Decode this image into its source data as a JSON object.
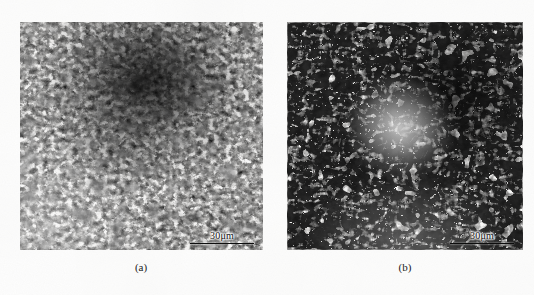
{
  "figure": {
    "type": "micrograph-pair",
    "background_color": "#fdfdfc",
    "panels": [
      {
        "id": "a",
        "caption": "(a)",
        "scale_bar": {
          "label": "30μm",
          "value": 30,
          "unit": "μm"
        },
        "description": "Optical metallographic micrograph, fine dendritic/eutectic microstructure with a dark coarse-phase cluster toward the upper centre"
      },
      {
        "id": "b",
        "caption": "(b)",
        "scale_bar": {
          "label": "30μm",
          "value": 30,
          "unit": "μm"
        },
        "description": "Optical metallographic micrograph, coarser and more outlined particle network with a lighter region near the centre"
      }
    ]
  }
}
